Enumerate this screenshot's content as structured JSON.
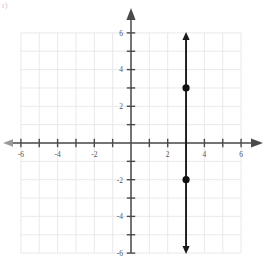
{
  "figure": {
    "corner_mark": "r)",
    "background_color": "#ffffff",
    "grid_color": "#e6e6ea",
    "axis_color": "#4a4a4a",
    "line_color": "#1a1a1a",
    "point_color": "#111111",
    "label_color": "#555555"
  },
  "chart_data": {
    "type": "scatter",
    "title": "",
    "xlabel": "",
    "ylabel": "",
    "xlim": [
      -6,
      6
    ],
    "ylim": [
      -6,
      6
    ],
    "grid": true,
    "legend": null,
    "x_tick_values": [
      -6,
      -5,
      -4,
      -3,
      -2,
      -1,
      1,
      2,
      3,
      4,
      5,
      6
    ],
    "y_tick_values": [
      6,
      5,
      4,
      3,
      2,
      1,
      -1,
      -2,
      -3,
      -4,
      -5,
      -6
    ],
    "x_tick_labels": [
      "-6",
      "-4",
      "-2",
      "2",
      "4",
      "6"
    ],
    "x_labeled_values": [
      -6,
      -4,
      -2,
      2,
      4,
      6
    ],
    "y_tick_labels": [
      "6",
      "4",
      "2",
      "-2",
      "-4",
      "-6"
    ],
    "y_labeled_values": [
      6,
      4,
      2,
      -2,
      -4,
      -6
    ],
    "axis_arrows": {
      "x_left": true,
      "x_right": true,
      "y_top": true,
      "y_bottom": false
    },
    "series": [
      {
        "name": "vertical-line",
        "type": "line",
        "equation": "x = 3",
        "x": [
          3,
          3
        ],
        "y": [
          6,
          -6
        ],
        "arrow_start": true,
        "arrow_end": true
      },
      {
        "name": "plotted-points",
        "type": "scatter",
        "points": [
          {
            "x": 3,
            "y": 3
          },
          {
            "x": 3,
            "y": -2
          }
        ]
      }
    ]
  }
}
